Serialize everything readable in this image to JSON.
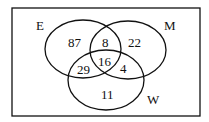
{
  "diagram": {
    "type": "venn",
    "sets": {
      "E": "E",
      "M": "M",
      "W": "W"
    },
    "regions": {
      "E_only": "87",
      "E_M_only": "8",
      "M_only": "22",
      "E_W_only": "29",
      "E_M_W": "16",
      "M_W_only": "4",
      "W_only": "11"
    },
    "colors": {
      "stroke": "#111111",
      "background": "#ffffff"
    }
  }
}
